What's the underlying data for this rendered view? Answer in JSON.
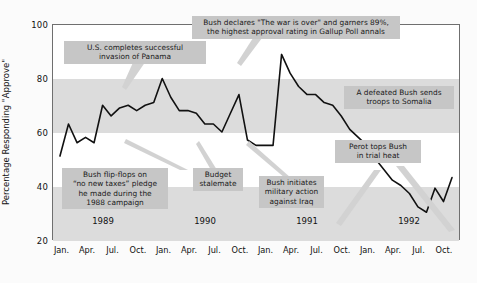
{
  "chart_data": {
    "type": "line",
    "title": "",
    "xlabel": "",
    "ylabel": "Percentage Responding \"Approve\"",
    "ylim": [
      20,
      100
    ],
    "yticks": [
      20,
      40,
      60,
      80,
      100
    ],
    "grid": false,
    "legend": "none",
    "year_labels": [
      "1989",
      "1990",
      "1991",
      "1992"
    ],
    "xticks": [
      "Jan.",
      "Apr.",
      "Jul.",
      "Oct.",
      "Jan.",
      "Apr.",
      "Jul.",
      "Oct.",
      "Jan.",
      "Apr.",
      "Jul.",
      "Oct.",
      "Jan.",
      "Apr.",
      "Jul.",
      "Oct."
    ],
    "series": [
      {
        "name": "Presidential approval (George H. W. Bush)",
        "x": [
          "1989-01",
          "1989-02",
          "1989-03",
          "1989-04",
          "1989-05",
          "1989-06",
          "1989-07",
          "1989-08",
          "1989-09",
          "1989-10",
          "1989-11",
          "1989-12",
          "1990-01",
          "1990-02",
          "1990-03",
          "1990-04",
          "1990-05",
          "1990-06",
          "1990-07",
          "1990-08",
          "1990-09",
          "1990-10",
          "1990-11",
          "1990-12",
          "1991-01",
          "1991-02",
          "1991-03",
          "1991-04",
          "1991-05",
          "1991-06",
          "1991-07",
          "1991-08",
          "1991-09",
          "1991-10",
          "1991-11",
          "1991-12",
          "1992-01",
          "1992-02",
          "1992-03",
          "1992-04",
          "1992-05",
          "1992-06",
          "1992-07",
          "1992-08",
          "1992-09",
          "1992-10",
          "1992-11"
        ],
        "values": [
          51,
          63,
          56,
          58,
          56,
          70,
          66,
          69,
          70,
          68,
          70,
          71,
          80,
          73,
          68,
          68,
          67,
          63,
          63,
          60,
          67,
          74,
          57,
          55,
          55,
          55,
          89,
          82,
          77,
          74,
          74,
          71,
          70,
          66,
          61,
          58,
          55,
          50,
          46,
          42,
          40,
          37,
          32,
          30,
          39,
          34,
          43
        ]
      }
    ],
    "annotations": [
      {
        "id": "panama",
        "text": "U.S. completes successful\ninvasion of Panama"
      },
      {
        "id": "war-over",
        "text": "Bush declares \"The war is over\" and garners 89%,\nthe highest approval rating in Gallup Poll annals"
      },
      {
        "id": "somalia",
        "text": "A defeated Bush sends\ntroops to Somalia"
      },
      {
        "id": "perot",
        "text": "Perot tops Bush\nin trial heat"
      },
      {
        "id": "taxes",
        "text": "Bush flip-flops on\n\"no new taxes\" pledge\nhe made during the\n1988 campaign"
      },
      {
        "id": "budget",
        "text": "Budget\nstalemate"
      },
      {
        "id": "iraq",
        "text": "Bush initiates\nmilitary action\nagainst Iraq"
      }
    ]
  },
  "axis": {
    "y_title": "Percentage Responding \"Approve\"",
    "y_labels": [
      "100",
      "80",
      "60",
      "40",
      "20"
    ],
    "x_labels": [
      "Jan.",
      "Apr.",
      "Jul.",
      "Oct.",
      "Jan.",
      "Apr.",
      "Jul.",
      "Oct.",
      "Jan.",
      "Apr.",
      "Jul.",
      "Oct.",
      "Jan.",
      "Apr.",
      "Jul.",
      "Oct."
    ],
    "years": [
      "1989",
      "1990",
      "1991",
      "1992"
    ]
  },
  "annotations": {
    "panama": {
      "line1": "U.S. completes successful",
      "line2": "invasion of Panama"
    },
    "war_over": {
      "line1": "Bush declares \"The war is over\" and garners 89%,",
      "line2": "the highest approval rating in Gallup Poll annals"
    },
    "somalia": {
      "line1": "A defeated Bush sends",
      "line2": "troops to Somalia"
    },
    "perot": {
      "line1": "Perot tops Bush",
      "line2": "in trial heat"
    },
    "taxes": {
      "line1": "Bush flip-flops on",
      "line2": "“no new taxes” pledge",
      "line3": "he made during the",
      "line4": "1988 campaign"
    },
    "budget": {
      "line1": "Budget",
      "line2": "stalemate"
    },
    "iraq": {
      "line1": "Bush initiates",
      "line2": "military action",
      "line3": "against Iraq"
    }
  },
  "colors": {
    "line": "#111111",
    "band": "#dcdcdc",
    "annotation_bg": "#c6c6c6",
    "frame": "#6f6f6f",
    "page_bg": "#fbfbfb"
  }
}
